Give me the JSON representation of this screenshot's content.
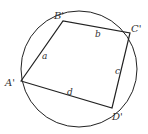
{
  "diagram": {
    "type": "cyclic-quadrilateral",
    "circle": {
      "cx": 79,
      "cy": 69,
      "r": 58
    },
    "vertices": [
      {
        "id": "A",
        "label": "A'",
        "x": 21,
        "y": 81,
        "lx": 5,
        "ly": 86
      },
      {
        "id": "B",
        "label": "B'",
        "x": 63,
        "y": 21,
        "lx": 54,
        "ly": 19
      },
      {
        "id": "C",
        "label": "C'",
        "x": 130,
        "y": 33,
        "lx": 131,
        "ly": 32
      },
      {
        "id": "D",
        "label": "D'",
        "x": 112,
        "y": 108,
        "lx": 112,
        "ly": 120
      }
    ],
    "sides": [
      {
        "label": "a",
        "lx": 42,
        "ly": 59
      },
      {
        "label": "b",
        "lx": 95,
        "ly": 37
      },
      {
        "label": "c",
        "lx": 115,
        "ly": 74
      },
      {
        "label": "d",
        "lx": 67,
        "ly": 95
      }
    ],
    "stroke_color": "#222222"
  }
}
